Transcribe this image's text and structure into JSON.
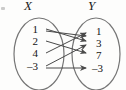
{
  "figure": {
    "type": "mapping-diagram",
    "sets": [
      {
        "id": "X",
        "label": "X",
        "side": "left",
        "elements": [
          {
            "value": "1",
            "y": 30
          },
          {
            "value": "2",
            "y": 42
          },
          {
            "value": "4",
            "y": 54
          },
          {
            "value": "–3",
            "y": 67
          }
        ]
      },
      {
        "id": "Y",
        "label": "Y",
        "side": "right",
        "elements": [
          {
            "value": "1",
            "y": 32
          },
          {
            "value": "3",
            "y": 44
          },
          {
            "value": "7",
            "y": 56
          },
          {
            "value": "–3",
            "y": 69
          }
        ]
      }
    ],
    "arrows": [
      {
        "from": "1",
        "to": "3",
        "x1": 44,
        "y1": 30,
        "x2": 84,
        "y2": 41
      },
      {
        "from": "2",
        "to": "7",
        "x1": 44,
        "y1": 43,
        "x2": 84,
        "y2": 53
      },
      {
        "from": "4",
        "to": "1",
        "x1": 44,
        "y1": 55,
        "x2": 84,
        "y2": 34
      },
      {
        "from": "–3",
        "to": "–3",
        "x1": 44,
        "y1": 68,
        "x2": 84,
        "y2": 67
      },
      {
        "from": "1",
        "to": "1",
        "x1": 44,
        "y1": 31,
        "x2": 84,
        "y2": 36
      },
      {
        "from": "–3",
        "to": "3",
        "x1": 44,
        "y1": 67,
        "x2": 84,
        "y2": 44
      }
    ],
    "colors": {
      "ink": "#3a3a3a",
      "text": "#141414",
      "ellipse_stroke": "#6f6f6f",
      "background": "#fdfdfc"
    }
  }
}
